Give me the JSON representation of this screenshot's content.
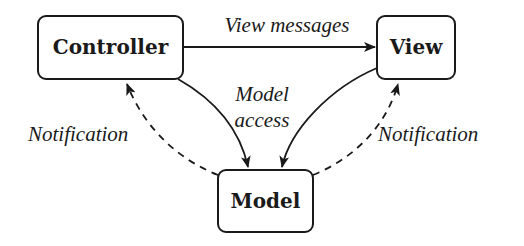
{
  "diagram": {
    "nodes": {
      "controller": {
        "label": "Controller"
      },
      "view": {
        "label": "View"
      },
      "model": {
        "label": "Model"
      }
    },
    "edges": {
      "controller_to_view": {
        "label": "View messages",
        "style": "solid"
      },
      "controller_to_model": {
        "label_line1": "Model",
        "label_line2": "access",
        "style": "solid"
      },
      "view_to_model": {
        "style": "solid"
      },
      "model_to_controller": {
        "label": "Notification",
        "style": "dashed"
      },
      "model_to_view": {
        "label": "Notification",
        "style": "dashed"
      }
    },
    "colors": {
      "stroke": "#1a1a1a",
      "background": "#ffffff"
    }
  }
}
